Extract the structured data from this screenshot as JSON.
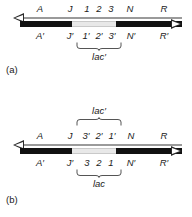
{
  "figure": {
    "panels": [
      {
        "id": "a",
        "caption": "(a)",
        "top_strand": {
          "type": "thin-line",
          "arrow": "left",
          "labels": [
            {
              "text": "A",
              "x": 40
            },
            {
              "text": "J",
              "x": 70
            },
            {
              "text": "1",
              "x": 87
            },
            {
              "text": "2",
              "x": 99
            },
            {
              "text": "3",
              "x": 111
            },
            {
              "text": "N",
              "x": 130
            },
            {
              "text": "R",
              "x": 164
            }
          ]
        },
        "bottom_strand": {
          "type": "thick-bar",
          "arrow": "right",
          "gap": {
            "start": 72,
            "end": 116
          },
          "labels": [
            {
              "text": "A′",
              "x": 40
            },
            {
              "text": "J′",
              "x": 70
            },
            {
              "text": "1′",
              "x": 86
            },
            {
              "text": "2′",
              "x": 99
            },
            {
              "text": "3′",
              "x": 112
            },
            {
              "text": "N′",
              "x": 131
            },
            {
              "text": "R′",
              "x": 164
            }
          ]
        },
        "brace": {
          "label": "lac′",
          "direction": "down",
          "center_x": 99
        }
      },
      {
        "id": "b",
        "caption": "(b)",
        "top_strand": {
          "type": "thin-line",
          "arrow": "left",
          "labels": [
            {
              "text": "A",
              "x": 40
            },
            {
              "text": "J",
              "x": 70
            },
            {
              "text": "3′",
              "x": 86
            },
            {
              "text": "2′",
              "x": 99
            },
            {
              "text": "1′",
              "x": 112
            },
            {
              "text": "N",
              "x": 131
            },
            {
              "text": "R",
              "x": 164
            }
          ]
        },
        "bottom_strand": {
          "type": "thick-bar",
          "arrow": "right",
          "gap": {
            "start": 72,
            "end": 116
          },
          "labels": [
            {
              "text": "A′",
              "x": 40
            },
            {
              "text": "J′",
              "x": 70
            },
            {
              "text": "3",
              "x": 87
            },
            {
              "text": "2",
              "x": 99
            },
            {
              "text": "1",
              "x": 111
            },
            {
              "text": "N′",
              "x": 131
            },
            {
              "text": "R′",
              "x": 164
            }
          ]
        },
        "brace_top": {
          "label": "lac′",
          "direction": "up",
          "center_x": 99
        },
        "brace_bottom": {
          "label": "lac",
          "direction": "down",
          "center_x": 99
        }
      }
    ]
  }
}
